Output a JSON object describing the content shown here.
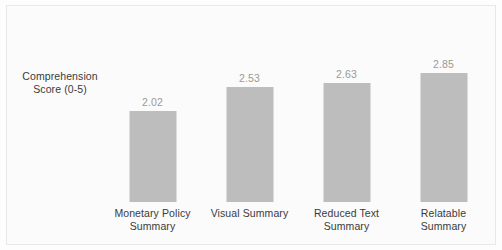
{
  "chart_data": {
    "type": "bar",
    "title": "",
    "xlabel": "",
    "ylabel": "Comprehension Score (0-5)",
    "ylabel_lines": [
      "Comprehension",
      "Score (0-5)"
    ],
    "categories": [
      "Monetary Policy Summary",
      "Visual Summary",
      "Reduced Text Summary",
      "Relatable Summary"
    ],
    "category_lines": [
      [
        "Monetary Policy",
        "Summary"
      ],
      [
        "Visual Summary"
      ],
      [
        "Reduced Text",
        "Summary"
      ],
      [
        "Relatable",
        "Summary"
      ]
    ],
    "values": [
      2.02,
      2.53,
      2.63,
      2.85
    ],
    "value_labels": [
      "2.02",
      "2.53",
      "2.63",
      "2.85"
    ],
    "ylim": [
      0,
      4.15
    ],
    "grid": false,
    "legend": "none",
    "bar_color": "#bdbdbd",
    "value_label_color": "#9a9a9a",
    "axis_text_color": "#3a3a3a",
    "background_color": "#fbfbfb",
    "border_color": "#e8e8e8"
  }
}
